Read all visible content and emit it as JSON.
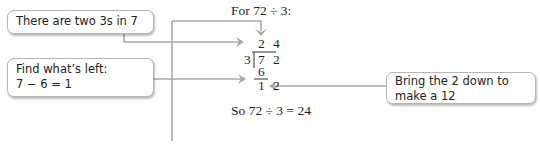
{
  "callouts": {
    "box1": "There are two 3s in 7",
    "box2_line1": "Find what’s left:",
    "box2_line2": "7 − 6 = 1",
    "box3_line1": "Bring the 2 down to",
    "box3_line2": "make a 12"
  },
  "division": {
    "title": "For 72 ÷ 3:",
    "quotient_d1": "2",
    "quotient_d2": "4",
    "divisor": "3",
    "dividend_d1": "7",
    "dividend_d2": "2",
    "subtract": "6",
    "remainder_d1": "1",
    "remainder_d2": "2",
    "conclusion": "So 72 ÷ 3 = 24"
  },
  "colors": {
    "connector": "#a9a9a9",
    "box_border": "#b5b5b5",
    "text": "#222222"
  }
}
